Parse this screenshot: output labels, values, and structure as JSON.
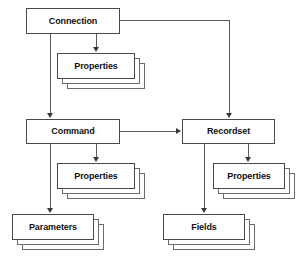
{
  "diagram": {
    "type": "object-model-hierarchy",
    "page_artifact": "",
    "colors": {
      "background": "#ffffff",
      "box_fill": "#ffffff",
      "box_border": "#4a4a4a",
      "stack_border": "#6b6b6b",
      "connector": "#5a5a5a",
      "arrowhead": "#3a3a3a",
      "text": "#111111"
    },
    "nodes": [
      {
        "id": "connection",
        "label": "Connection",
        "style": "single"
      },
      {
        "id": "connection-properties",
        "label": "Properties",
        "style": "stack"
      },
      {
        "id": "command",
        "label": "Command",
        "style": "single"
      },
      {
        "id": "command-properties",
        "label": "Properties",
        "style": "stack"
      },
      {
        "id": "parameters",
        "label": "Parameters",
        "style": "stack"
      },
      {
        "id": "recordset",
        "label": "Recordset",
        "style": "single"
      },
      {
        "id": "recordset-properties",
        "label": "Properties",
        "style": "stack"
      },
      {
        "id": "fields",
        "label": "Fields",
        "style": "stack"
      }
    ],
    "edges": [
      {
        "from": "connection",
        "to": "recordset",
        "path": "right-down"
      },
      {
        "from": "connection",
        "to": "connection-properties",
        "path": "down"
      },
      {
        "from": "connection",
        "to": "command",
        "path": "down"
      },
      {
        "from": "command",
        "to": "recordset",
        "path": "right"
      },
      {
        "from": "command",
        "to": "command-properties",
        "path": "down"
      },
      {
        "from": "command",
        "to": "parameters",
        "path": "down"
      },
      {
        "from": "recordset",
        "to": "recordset-properties",
        "path": "down"
      },
      {
        "from": "recordset",
        "to": "fields",
        "path": "down"
      }
    ]
  }
}
